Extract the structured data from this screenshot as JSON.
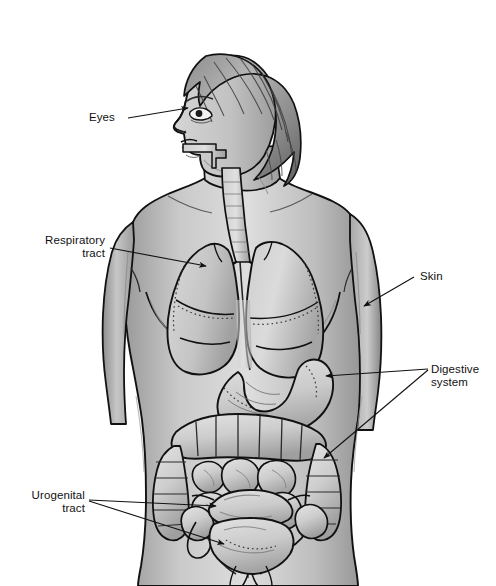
{
  "figure": {
    "view": "anterior torso with left-facing head profile",
    "background_color": "#ffffff",
    "line_color": "#111111",
    "skin_fill_light": "#d8d8d8",
    "skin_fill_mid": "#b6b6b6",
    "skin_fill_dark": "#8d8d8d",
    "organ_fill_light": "#dcdcdc",
    "organ_fill_mid": "#bdbdbd",
    "hair_fill_dark": "#6e6e6e",
    "width": 496,
    "height": 586
  },
  "labels": {
    "eyes": {
      "line1": "Eyes"
    },
    "respiratory": {
      "line1": "Respiratory",
      "line2": "tract"
    },
    "skin": {
      "line1": "Skin"
    },
    "digestive": {
      "line1": "Digestive",
      "line2": "system"
    },
    "urogenital": {
      "line1": "Urogenital",
      "line2": "tract"
    }
  },
  "anatomy_parts": [
    {
      "name": "head-profile",
      "label": "Head, left-facing profile"
    },
    {
      "name": "hair",
      "label": "Short bob hairstyle"
    },
    {
      "name": "eye",
      "label": "Eye"
    },
    {
      "name": "nose",
      "label": "Nose"
    },
    {
      "name": "lips",
      "label": "Lips"
    },
    {
      "name": "neck",
      "label": "Neck"
    },
    {
      "name": "trachea",
      "label": "Trachea / airway"
    },
    {
      "name": "left-lung",
      "label": "Left lung"
    },
    {
      "name": "right-lung",
      "label": "Right lung"
    },
    {
      "name": "esophagus",
      "label": "Esophagus"
    },
    {
      "name": "stomach",
      "label": "Stomach"
    },
    {
      "name": "transverse-colon",
      "label": "Transverse colon"
    },
    {
      "name": "ascending-colon",
      "label": "Ascending colon"
    },
    {
      "name": "descending-colon",
      "label": "Descending colon"
    },
    {
      "name": "small-intestine",
      "label": "Small intestine"
    },
    {
      "name": "bladder",
      "label": "Urinary bladder"
    },
    {
      "name": "uterus",
      "label": "Uterus"
    },
    {
      "name": "left-arm",
      "label": "Left arm"
    },
    {
      "name": "right-arm",
      "label": "Right arm"
    },
    {
      "name": "torso",
      "label": "Torso outline"
    },
    {
      "name": "breast",
      "label": "Breast"
    },
    {
      "name": "hips",
      "label": "Hips"
    }
  ],
  "leader_lines": [
    {
      "name": "eyes-leader",
      "from_label": "eyes",
      "to_part": "eye",
      "arrow": true
    },
    {
      "name": "respiratory-leader",
      "from_label": "respiratory",
      "to_part": "right-lung",
      "arrow": true
    },
    {
      "name": "skin-leader",
      "from_label": "skin",
      "to_part": "left-arm",
      "arrow": true
    },
    {
      "name": "digestive-leader-stomach",
      "from_label": "digestive",
      "to_part": "stomach",
      "arrow": true
    },
    {
      "name": "digestive-leader-intestine",
      "from_label": "digestive",
      "to_part": "descending-colon",
      "arrow": true
    },
    {
      "name": "urogenital-leader-uterus",
      "from_label": "urogenital",
      "to_part": "uterus",
      "arrow": true
    },
    {
      "name": "urogenital-leader-bladder",
      "from_label": "urogenital",
      "to_part": "bladder",
      "arrow": true
    }
  ]
}
